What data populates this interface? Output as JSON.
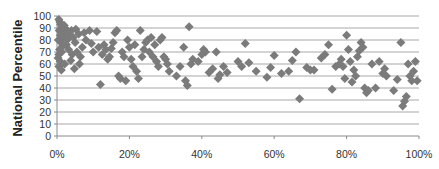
{
  "chart_data": {
    "type": "scatter",
    "title": "",
    "xlabel": "",
    "ylabel": "National Percentile",
    "xlim": [
      0,
      100
    ],
    "ylim": [
      0,
      100
    ],
    "x_ticks": [
      "0%",
      "20%",
      "40%",
      "60%",
      "80%",
      "100%"
    ],
    "y_ticks": [
      "0",
      "10",
      "20",
      "30",
      "40",
      "50",
      "60",
      "70",
      "80",
      "90",
      "100"
    ],
    "grid": true,
    "legend": null,
    "marker": "diamond",
    "marker_color": "#7b7b7b",
    "series": [
      {
        "name": "Schools",
        "points": [
          [
            0.5,
            97
          ],
          [
            0.8,
            95
          ],
          [
            1,
            93
          ],
          [
            1.2,
            90
          ],
          [
            0.6,
            88
          ],
          [
            1.5,
            86
          ],
          [
            0.9,
            84
          ],
          [
            1.8,
            82
          ],
          [
            0.4,
            80
          ],
          [
            1.1,
            78
          ],
          [
            2,
            92
          ],
          [
            2.5,
            89
          ],
          [
            3,
            87
          ],
          [
            2.2,
            85
          ],
          [
            1.6,
            75
          ],
          [
            0.7,
            72
          ],
          [
            1.3,
            70
          ],
          [
            0.5,
            68
          ],
          [
            2.8,
            80
          ],
          [
            3.5,
            84
          ],
          [
            0.3,
            65
          ],
          [
            0.9,
            62
          ],
          [
            0.5,
            58
          ],
          [
            1.2,
            55
          ],
          [
            2.6,
            76
          ],
          [
            3.2,
            72
          ],
          [
            4,
            88
          ],
          [
            4.5,
            82
          ],
          [
            5,
            78
          ],
          [
            5.5,
            70
          ],
          [
            6,
            85
          ],
          [
            4.2,
            68
          ],
          [
            3.8,
            63
          ],
          [
            2.1,
            60
          ],
          [
            4.8,
            56
          ],
          [
            6.5,
            66
          ],
          [
            7,
            74
          ],
          [
            7.5,
            86
          ],
          [
            8,
            80
          ],
          [
            6.2,
            60
          ],
          [
            5.2,
            89
          ],
          [
            9,
            88
          ],
          [
            9.5,
            77
          ],
          [
            10,
            70
          ],
          [
            11,
            87
          ],
          [
            11.5,
            74
          ],
          [
            12,
            43
          ],
          [
            12.5,
            68
          ],
          [
            13,
            76
          ],
          [
            13.5,
            72
          ],
          [
            14,
            64
          ],
          [
            14.5,
            66
          ],
          [
            15,
            73
          ],
          [
            15.5,
            78
          ],
          [
            16,
            86
          ],
          [
            16.5,
            88
          ],
          [
            17,
            50
          ],
          [
            17.5,
            48
          ],
          [
            18,
            70
          ],
          [
            18.5,
            66
          ],
          [
            19,
            46
          ],
          [
            19.5,
            80
          ],
          [
            20,
            74
          ],
          [
            20.5,
            64
          ],
          [
            21,
            58
          ],
          [
            21.5,
            76
          ],
          [
            22,
            54
          ],
          [
            22.5,
            48
          ],
          [
            23,
            88
          ],
          [
            23.5,
            66
          ],
          [
            24,
            72
          ],
          [
            24.5,
            78
          ],
          [
            25,
            80
          ],
          [
            25.5,
            70
          ],
          [
            26,
            82
          ],
          [
            26.5,
            66
          ],
          [
            27,
            76
          ],
          [
            27.5,
            62
          ],
          [
            28,
            58
          ],
          [
            28.5,
            80
          ],
          [
            29,
            82
          ],
          [
            29.5,
            66
          ],
          [
            30,
            64
          ],
          [
            30.5,
            60
          ],
          [
            31,
            54
          ],
          [
            33,
            50
          ],
          [
            34,
            58
          ],
          [
            35,
            74
          ],
          [
            35.5,
            46
          ],
          [
            36,
            42
          ],
          [
            36.5,
            91
          ],
          [
            37,
            60
          ],
          [
            37.5,
            64
          ],
          [
            39,
            62
          ],
          [
            40,
            68
          ],
          [
            41,
            70
          ],
          [
            42,
            53
          ],
          [
            43,
            56
          ],
          [
            44,
            70
          ],
          [
            45,
            51
          ],
          [
            46,
            58
          ],
          [
            47,
            53
          ],
          [
            50,
            62
          ],
          [
            51,
            58
          ],
          [
            52,
            77
          ],
          [
            53,
            61
          ],
          [
            58,
            49
          ],
          [
            59,
            57
          ],
          [
            62,
            52
          ],
          [
            64,
            54
          ],
          [
            65,
            63
          ],
          [
            66,
            70
          ],
          [
            67,
            31
          ],
          [
            69,
            57
          ],
          [
            70,
            55
          ],
          [
            71,
            55
          ],
          [
            73,
            65
          ],
          [
            74,
            68
          ],
          [
            75,
            76
          ],
          [
            76,
            39
          ],
          [
            77,
            58
          ],
          [
            78,
            60
          ],
          [
            78.5,
            64
          ],
          [
            79,
            58
          ],
          [
            79.5,
            48
          ],
          [
            80,
            84
          ],
          [
            80.5,
            72
          ],
          [
            81,
            62
          ],
          [
            81.5,
            45
          ],
          [
            82,
            55
          ],
          [
            82.5,
            50
          ],
          [
            83,
            66
          ],
          [
            83.5,
            71
          ],
          [
            84,
            78
          ],
          [
            84.5,
            74
          ],
          [
            85,
            40
          ],
          [
            85.5,
            36
          ],
          [
            86,
            38
          ],
          [
            87,
            60
          ],
          [
            88,
            40
          ],
          [
            89,
            62
          ],
          [
            90,
            52
          ],
          [
            90.5,
            56
          ],
          [
            91,
            50
          ],
          [
            93,
            38
          ],
          [
            94,
            47
          ],
          [
            95,
            78
          ],
          [
            95.5,
            25
          ],
          [
            96,
            29
          ],
          [
            96.5,
            33
          ],
          [
            97,
            60
          ],
          [
            97.5,
            50
          ],
          [
            98,
            46
          ],
          [
            98.5,
            54
          ],
          [
            99,
            62
          ],
          [
            99.5,
            46
          ],
          [
            40.5,
            72
          ],
          [
            55,
            54
          ],
          [
            60,
            67
          ],
          [
            44.5,
            48
          ]
        ]
      }
    ]
  }
}
